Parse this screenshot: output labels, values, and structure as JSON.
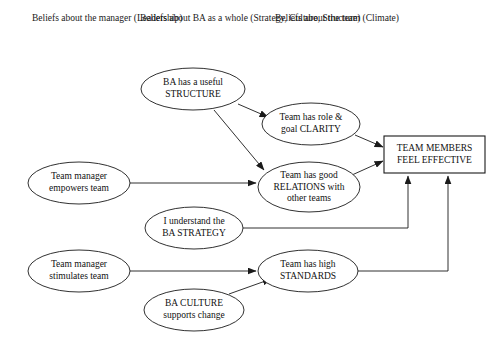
{
  "diagram": {
    "columns": [
      {
        "id": "leadership",
        "line1": "Beliefs about",
        "line2": "the manager",
        "line3": "(Leadership)"
      },
      {
        "id": "ba-as-a-whole",
        "line1": "Beliefs about",
        "line2": "BA as a whole",
        "line3": "(Strategy, Culture, Structure)"
      },
      {
        "id": "team",
        "line1": "Beliefs about",
        "line2": "the team",
        "line3": "(Climate)"
      }
    ],
    "nodes": [
      {
        "id": "ba-structure",
        "shape": "ellipse",
        "line1": "BA has a useful",
        "line2": "STRUCTURE",
        "line3": ""
      },
      {
        "id": "team-clarity",
        "shape": "ellipse",
        "line1": "Team has role &",
        "line2": "goal CLARITY",
        "line3": ""
      },
      {
        "id": "team-effective",
        "shape": "rectangle",
        "line1": "TEAM MEMBERS",
        "line2": "FEEL EFFECTIVE",
        "line3": ""
      },
      {
        "id": "manager-empowers",
        "shape": "ellipse",
        "line1": "Team manager",
        "line2": "empowers team",
        "line3": ""
      },
      {
        "id": "team-relations",
        "shape": "ellipse",
        "line1": "Team has good",
        "line2": "RELATIONS with",
        "line3": "other teams"
      },
      {
        "id": "ba-strategy",
        "shape": "ellipse",
        "line1": "I understand the",
        "line2": "BA STRATEGY",
        "line3": ""
      },
      {
        "id": "manager-stimulates",
        "shape": "ellipse",
        "line1": "Team manager",
        "line2": "stimulates team",
        "line3": ""
      },
      {
        "id": "team-standards",
        "shape": "ellipse",
        "line1": "Team has high",
        "line2": "STANDARDS",
        "line3": ""
      },
      {
        "id": "ba-culture",
        "shape": "ellipse",
        "line1": "BA CULTURE",
        "line2": "supports change",
        "line3": ""
      }
    ],
    "edges": [
      {
        "id": "edge-structure-to-clarity",
        "from": "ba-structure",
        "to": "team-clarity"
      },
      {
        "id": "edge-structure-to-relations",
        "from": "ba-structure",
        "to": "team-relations"
      },
      {
        "id": "edge-clarity-to-effective",
        "from": "team-clarity",
        "to": "team-effective"
      },
      {
        "id": "edge-empowers-to-relations",
        "from": "manager-empowers",
        "to": "team-relations"
      },
      {
        "id": "edge-relations-to-effective",
        "from": "team-relations",
        "to": "team-effective"
      },
      {
        "id": "edge-strategy-to-effective",
        "from": "ba-strategy",
        "to": "team-effective"
      },
      {
        "id": "edge-stimulates-to-standards",
        "from": "manager-stimulates",
        "to": "team-standards"
      },
      {
        "id": "edge-culture-to-standards",
        "from": "ba-culture",
        "to": "team-standards"
      },
      {
        "id": "edge-standards-to-effective",
        "from": "team-standards",
        "to": "team-effective"
      }
    ],
    "colors": {
      "stroke": "#1a1a1a",
      "text": "#111111",
      "background": "#ffffff"
    }
  }
}
